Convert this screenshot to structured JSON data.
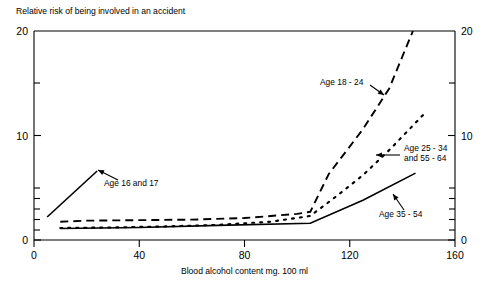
{
  "chart_data": {
    "type": "line",
    "title": "Relative risk of being involved in an accident",
    "xlabel": "Blood alcohol content mg. 100 ml",
    "ylabel": "",
    "xlim": [
      0,
      160
    ],
    "ylim": [
      0,
      20
    ],
    "xticks": [
      0,
      40,
      80,
      120,
      160
    ],
    "xticklabels": [
      "0",
      "40",
      "80",
      "120",
      "160"
    ],
    "yticks": [
      0,
      10,
      20
    ],
    "yticklabels": [
      "0",
      "10",
      "20"
    ],
    "y_minor_ticks": [
      1,
      2,
      3,
      4,
      5,
      15
    ],
    "grid": false,
    "legend_position": "inline-annotations",
    "right_axis_mirror": true,
    "right_yticklabels": [
      "0",
      "10",
      "20"
    ],
    "series": [
      {
        "name": "Age 16 and 17",
        "style": "solid",
        "x": [
          5,
          24
        ],
        "values": [
          2.2,
          6.6
        ]
      },
      {
        "name": "Age 18 - 24",
        "style": "dashed",
        "x": [
          10,
          20,
          40,
          60,
          80,
          100,
          105,
          112,
          125,
          135,
          144
        ],
        "values": [
          1.75,
          1.85,
          1.9,
          1.95,
          2.1,
          2.5,
          2.7,
          6.3,
          10.6,
          14.5,
          20.0
        ]
      },
      {
        "name": "Age 25 - 34 and 55 - 64",
        "style": "dotted",
        "x": [
          10,
          30,
          50,
          70,
          90,
          105,
          115,
          125,
          135,
          148
        ],
        "values": [
          1.15,
          1.2,
          1.3,
          1.45,
          1.75,
          2.3,
          4.2,
          6.2,
          8.6,
          12.0
        ]
      },
      {
        "name": "Age 35 - 54",
        "style": "solid",
        "x": [
          10,
          40,
          70,
          105,
          125,
          145
        ],
        "values": [
          1.1,
          1.2,
          1.4,
          1.6,
          3.8,
          6.4
        ]
      }
    ],
    "annotations": [
      {
        "text_line1": "Age 16 and 17",
        "text_line2": "",
        "label_x": 104,
        "label_y": 186,
        "arrow_from_x": 118,
        "arrow_from_y": 180,
        "arrow_to_x": 98,
        "arrow_to_y": 170
      },
      {
        "text_line1": "Age 18 - 24",
        "text_line2": "",
        "label_x": 320,
        "label_y": 85,
        "arrow_from_x": 370,
        "arrow_from_y": 85,
        "arrow_to_x": 384,
        "arrow_to_y": 95
      },
      {
        "text_line1": "Age 25 - 34",
        "text_line2": "and 55 - 64",
        "label_x": 404,
        "label_y": 151,
        "arrow_from_x": 400,
        "arrow_from_y": 155,
        "arrow_to_x": 376,
        "arrow_to_y": 155
      },
      {
        "text_line1": "Age 35 - 54",
        "text_line2": "",
        "label_x": 379,
        "label_y": 217,
        "arrow_from_x": 404,
        "arrow_from_y": 210,
        "arrow_to_x": 393,
        "arrow_to_y": 194
      }
    ]
  },
  "axis": {
    "x_tick_0": "0",
    "x_tick_40": "40",
    "x_tick_80": "80",
    "x_tick_120": "120",
    "x_tick_160": "160",
    "y_tick_0_left": "0",
    "y_tick_10_left": "10",
    "y_tick_20_left": "20",
    "y_tick_0_right": "0",
    "y_tick_10_right": "10",
    "y_tick_20_right": "20"
  },
  "labels": {
    "title": "Relative risk of being involved in an accident",
    "xlabel": "Blood alcohol content mg. 100 ml"
  }
}
